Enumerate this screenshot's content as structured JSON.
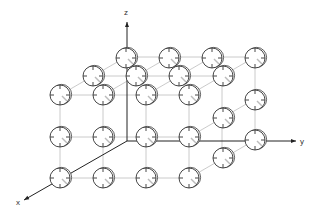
{
  "figure": {
    "type": "3d-lattice",
    "colors": {
      "line": "#bdbdbd",
      "axis": "#222222",
      "atom": "#333333",
      "shade": "#bbbbbb"
    }
  },
  "axes": {
    "origin": [
      127,
      141
    ],
    "x": {
      "label": "x",
      "end": [
        24,
        200
      ],
      "label_pos": [
        16,
        205
      ]
    },
    "y": {
      "label": "y",
      "end": [
        296,
        141
      ],
      "label_pos": [
        300,
        144
      ]
    },
    "z": {
      "label": "z",
      "end": [
        127,
        22
      ],
      "label_pos": [
        124,
        15
      ]
    }
  },
  "lattice": {
    "front_face": {
      "xs": [
        60,
        103,
        146,
        189
      ],
      "ys": [
        95,
        137,
        178
      ]
    },
    "offsets": {
      "depth_step": [
        33,
        -19
      ]
    },
    "atoms": [
      [
        126,
        58
      ],
      [
        169,
        58
      ],
      [
        212,
        58
      ],
      [
        255,
        58
      ],
      [
        93,
        76
      ],
      [
        136,
        76
      ],
      [
        179,
        76
      ],
      [
        223,
        76
      ],
      [
        60,
        95
      ],
      [
        103,
        95
      ],
      [
        146,
        95
      ],
      [
        189,
        95
      ],
      [
        223,
        118
      ],
      [
        255,
        100
      ],
      [
        60,
        137
      ],
      [
        103,
        137
      ],
      [
        146,
        137
      ],
      [
        189,
        137
      ],
      [
        223,
        158
      ],
      [
        255,
        140
      ],
      [
        60,
        178
      ],
      [
        103,
        178
      ],
      [
        146,
        178
      ],
      [
        189,
        178
      ]
    ]
  }
}
